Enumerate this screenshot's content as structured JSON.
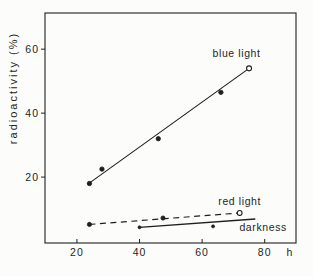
{
  "figure": {
    "background": "#fcfcfa",
    "ink": "#1f1f1f"
  },
  "chart_data": {
    "type": "scatter",
    "title": "",
    "xlabel": "h",
    "ylabel": "radioactivity (%)",
    "xlim": [
      9.8,
      90
    ],
    "ylim": [
      -0.6,
      71.3
    ],
    "x_ticks": [
      20,
      40,
      60,
      80
    ],
    "y_ticks": [
      20,
      40,
      60
    ],
    "grid": false,
    "legend_position": "inline-annotations",
    "series": [
      {
        "name": "blue light",
        "line_style": "solid",
        "line_width": 1.1,
        "marker_size": 2.2,
        "points": [
          {
            "x": 24,
            "y": 18,
            "marker": "dot"
          },
          {
            "x": 28,
            "y": 22.5,
            "marker": "dot"
          },
          {
            "x": 46,
            "y": 32,
            "marker": "dot"
          },
          {
            "x": 66,
            "y": 46.5,
            "marker": "dot"
          },
          {
            "x": 75,
            "y": 54,
            "marker": "circle"
          }
        ],
        "line_from": {
          "x": 23.5,
          "y": 17.8
        },
        "line_to": {
          "x": 75,
          "y": 54
        }
      },
      {
        "name": "red light",
        "line_style": "dashed",
        "line_width": 1.2,
        "marker_size": 2.1,
        "points": [
          {
            "x": 24,
            "y": 5.2,
            "marker": "dot"
          },
          {
            "x": 47.5,
            "y": 7.2,
            "marker": "dot"
          },
          {
            "x": 72,
            "y": 8.8,
            "marker": "circle"
          }
        ],
        "line_from": {
          "x": 24,
          "y": 5.2
        },
        "line_to": {
          "x": 72,
          "y": 8.8
        }
      },
      {
        "name": "darkness",
        "line_style": "solid",
        "line_width": 1.3,
        "marker_size": 1.5,
        "points": [
          {
            "x": 40,
            "y": 4.3,
            "marker": "dot"
          },
          {
            "x": 63.5,
            "y": 4.6,
            "marker": "dot"
          }
        ],
        "line_from": {
          "x": 40,
          "y": 4.3
        },
        "line_to": {
          "x": 77,
          "y": 6.9
        }
      }
    ],
    "annotations": [
      {
        "text": "blue light",
        "x": 71,
        "y": 58.5
      },
      {
        "text": "red light",
        "x": 72,
        "y": 12.3
      },
      {
        "text": "darkness",
        "x": 79.5,
        "y": 4.4
      }
    ]
  }
}
